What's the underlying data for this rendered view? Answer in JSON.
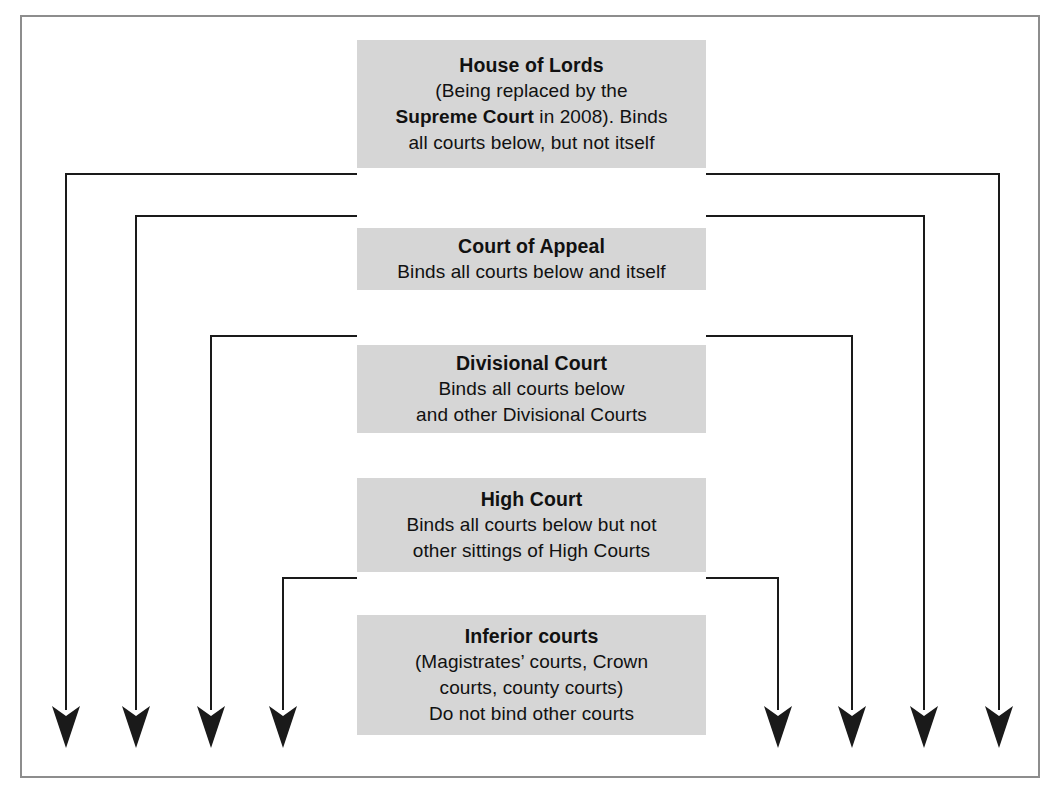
{
  "diagram": {
    "title": "Hierarchy of the courts and binding precedent",
    "frame": {
      "border_color": "#8d8d8d",
      "background": "#ffffff"
    },
    "box_style": {
      "fill": "#d6d6d6",
      "text_color": "#111111"
    },
    "connector_style": {
      "color": "#1a1a1a",
      "width": 2
    },
    "levels": [
      {
        "id": "house-of-lords",
        "name": "House of Lords",
        "title": "House of Lords",
        "lines": [
          {
            "segments": [
              {
                "text": "(Being replaced by the",
                "bold": false
              }
            ]
          },
          {
            "segments": [
              {
                "text": "Supreme Court",
                "bold": true
              },
              {
                "text": " in 2008). Binds",
                "bold": false
              }
            ]
          },
          {
            "segments": [
              {
                "text": "all courts below, but not itself",
                "bold": false
              }
            ]
          }
        ],
        "rect": {
          "x": 357,
          "y": 40,
          "w": 349,
          "h": 128
        }
      },
      {
        "id": "court-of-appeal",
        "name": "Court of Appeal",
        "title": "Court of Appeal",
        "lines": [
          {
            "segments": [
              {
                "text": "Binds all courts below and itself",
                "bold": false
              }
            ]
          }
        ],
        "rect": {
          "x": 357,
          "y": 228,
          "w": 349,
          "h": 62
        }
      },
      {
        "id": "divisional-court",
        "name": "Divisional Court",
        "title": "Divisional Court",
        "lines": [
          {
            "segments": [
              {
                "text": "Binds all courts below",
                "bold": false
              }
            ]
          },
          {
            "segments": [
              {
                "text": "and other Divisional Courts",
                "bold": false
              }
            ]
          }
        ],
        "rect": {
          "x": 357,
          "y": 345,
          "w": 349,
          "h": 88
        }
      },
      {
        "id": "high-court",
        "name": "High Court",
        "title": "High Court",
        "lines": [
          {
            "segments": [
              {
                "text": "Binds all courts below but not",
                "bold": false
              }
            ]
          },
          {
            "segments": [
              {
                "text": "other sittings of High Courts",
                "bold": false
              }
            ]
          }
        ],
        "rect": {
          "x": 357,
          "y": 478,
          "w": 349,
          "h": 94
        }
      },
      {
        "id": "inferior-courts",
        "name": "Inferior courts",
        "title": "Inferior courts",
        "lines": [
          {
            "segments": [
              {
                "text": "(Magistrates’ courts, Crown",
                "bold": false
              }
            ]
          },
          {
            "segments": [
              {
                "text": "courts, county courts)",
                "bold": false
              }
            ]
          },
          {
            "segments": [
              {
                "text": "Do not bind other courts",
                "bold": false
              }
            ]
          }
        ],
        "rect": {
          "x": 357,
          "y": 615,
          "w": 349,
          "h": 120
        }
      }
    ],
    "connectors": [
      {
        "id": "hol-left",
        "from": "house-of-lords",
        "side": "left",
        "elbow_y": 174,
        "x": 66,
        "arrow_tip_y": 748
      },
      {
        "id": "hol-right",
        "from": "house-of-lords",
        "side": "right",
        "elbow_y": 174,
        "x": 999,
        "arrow_tip_y": 748
      },
      {
        "id": "coa-left",
        "from": "court-of-appeal",
        "side": "left",
        "elbow_y": 216,
        "x": 136,
        "arrow_tip_y": 748
      },
      {
        "id": "coa-right",
        "from": "court-of-appeal",
        "side": "right",
        "elbow_y": 216,
        "x": 924,
        "arrow_tip_y": 748
      },
      {
        "id": "div-left",
        "from": "divisional-court",
        "side": "left",
        "elbow_y": 336,
        "x": 211,
        "arrow_tip_y": 748
      },
      {
        "id": "div-right",
        "from": "divisional-court",
        "side": "right",
        "elbow_y": 336,
        "x": 852,
        "arrow_tip_y": 748
      },
      {
        "id": "high-left",
        "from": "high-court",
        "side": "left",
        "elbow_y": 578,
        "x": 283,
        "arrow_tip_y": 748
      },
      {
        "id": "high-right",
        "from": "high-court",
        "side": "right",
        "elbow_y": 578,
        "x": 778,
        "arrow_tip_y": 748
      }
    ]
  }
}
